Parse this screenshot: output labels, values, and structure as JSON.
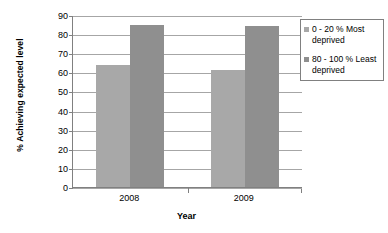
{
  "chart_data": {
    "type": "bar",
    "title": "",
    "xlabel": "Year",
    "ylabel": "% Achieving expected level",
    "categories": [
      "2008",
      "2009"
    ],
    "series": [
      {
        "name": "0 - 20 % Most deprived",
        "values": [
          64,
          61
        ],
        "color": "#a8a8a8"
      },
      {
        "name": "80 - 100 % Least deprived",
        "values": [
          85,
          84
        ],
        "color": "#8f8f8f"
      }
    ],
    "ylim": [
      0,
      90
    ],
    "yticks": [
      0,
      10,
      20,
      30,
      40,
      50,
      60,
      70,
      80,
      90
    ],
    "ytick_labels": [
      "0",
      "10",
      "20",
      "30",
      "40",
      "50",
      "60",
      "70",
      "80",
      "90"
    ],
    "grid": true,
    "legend_position": "right"
  },
  "legend": {
    "items": [
      {
        "label": "0 - 20 % Most deprived",
        "color": "#a8a8a8"
      },
      {
        "label": "80 - 100 % Least deprived",
        "color": "#8f8f8f"
      }
    ]
  },
  "axes": {
    "y_title": "% Achieving expected level",
    "x_title": "Year"
  }
}
